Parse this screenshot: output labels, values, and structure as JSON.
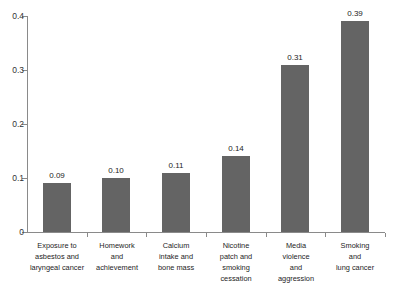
{
  "chart_data": {
    "type": "bar",
    "title": "",
    "subtitle": "",
    "xlabel": "",
    "ylabel": "",
    "ylim": [
      0,
      0.4
    ],
    "yticks": [
      "0",
      "0.1",
      "0.2",
      "0.3",
      "0.4"
    ],
    "ytick_values": [
      0,
      0.1,
      0.2,
      0.3,
      0.4
    ],
    "grid": false,
    "legend": false,
    "bar_color": "#646464",
    "axis_color": "#8a8a8a",
    "categories": [
      "Exposure to asbestos and laryngeal cancer",
      "Homework and achievement",
      "Calcium intake and bone mass",
      "Nicotine patch and smoking cessation",
      "Media violence and aggression",
      "Smoking and lung cancer"
    ],
    "category_lines": [
      [
        "Exposure to",
        "asbestos and",
        "laryngeal cancer"
      ],
      [
        "Homework",
        "and",
        "achievement"
      ],
      [
        "Calcium",
        "intake and",
        "bone mass"
      ],
      [
        "Nicotine",
        "patch and",
        "smoking",
        "cessation"
      ],
      [
        "Media",
        "violence",
        "and",
        "aggression"
      ],
      [
        "Smoking",
        "and",
        "lung cancer"
      ]
    ],
    "values": [
      0.09,
      0.1,
      0.11,
      0.14,
      0.31,
      0.39
    ],
    "value_labels": [
      "0.09",
      "0.10",
      "0.11",
      "0.14",
      "0.31",
      "0.39"
    ]
  }
}
